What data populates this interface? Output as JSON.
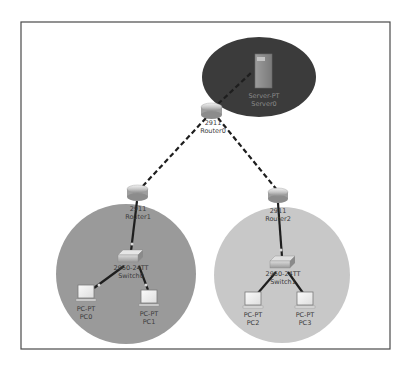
{
  "diagram": {
    "type": "network-topology",
    "frame": {
      "x": 21,
      "y": 22,
      "width": 369,
      "height": 327
    },
    "colors": {
      "frame_border": "#4a4a4a",
      "server_zone": "#3b3b3b",
      "lan1_zone": "#9a9a9a",
      "lan2_zone": "#c8c8c8",
      "link": "#1e1e1e",
      "label": "#3a3a3a",
      "label_on_dark": "#8a8a8a"
    },
    "zones": [
      {
        "id": "server-zone",
        "shape": "ellipse",
        "cx": 259,
        "cy": 77,
        "rx": 57,
        "ry": 40
      },
      {
        "id": "lan1-zone",
        "shape": "circle",
        "cx": 126,
        "cy": 274,
        "r": 70
      },
      {
        "id": "lan2-zone",
        "shape": "circle",
        "cx": 282,
        "cy": 275,
        "r": 68
      }
    ],
    "nodes": {
      "server0": {
        "model": "Server-PT",
        "name": "Server0"
      },
      "router0": {
        "model": "2911",
        "name": "Router0"
      },
      "router1": {
        "model": "2911",
        "name": "Router1"
      },
      "router2": {
        "model": "2911",
        "name": "Router2"
      },
      "switch0": {
        "model": "2960-24TT",
        "name": "Switch0"
      },
      "switch1": {
        "model": "2960-24TT",
        "name": "Switch1"
      },
      "pc0": {
        "model": "PC-PT",
        "name": "PC0"
      },
      "pc1": {
        "model": "PC-PT",
        "name": "PC1"
      },
      "pc2": {
        "model": "PC-PT",
        "name": "PC2"
      },
      "pc3": {
        "model": "PC-PT",
        "name": "PC3"
      }
    },
    "links": [
      {
        "from": "router0",
        "to": "server0",
        "style": "dashed"
      },
      {
        "from": "router0",
        "to": "router1",
        "style": "dashed"
      },
      {
        "from": "router0",
        "to": "router2",
        "style": "dashed"
      },
      {
        "from": "router1",
        "to": "switch0",
        "style": "solid"
      },
      {
        "from": "router2",
        "to": "switch1",
        "style": "solid"
      },
      {
        "from": "switch0",
        "to": "pc0",
        "style": "solid"
      },
      {
        "from": "switch0",
        "to": "pc1",
        "style": "solid"
      },
      {
        "from": "switch1",
        "to": "pc2",
        "style": "solid"
      },
      {
        "from": "switch1",
        "to": "pc3",
        "style": "solid"
      }
    ]
  }
}
